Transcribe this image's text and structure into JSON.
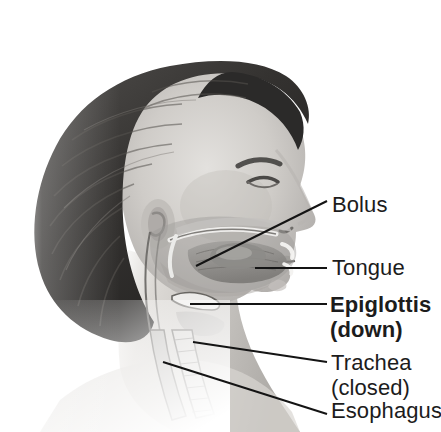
{
  "figure": {
    "width": 441,
    "height": 432,
    "background_color": "#ffffff"
  },
  "marker": {
    "name": "down-triangle-marker",
    "shape": "triangle-down",
    "color": "#2e2e2e"
  },
  "photo": {
    "description": "Grayscale profile photograph of a young person's head and neck with a sagittal anatomical cross-section overlay of the mouth, pharynx, larynx and esophagus.",
    "hair_color": "#3a3a3a",
    "skin_color": "#c9c6c2",
    "overlay_color": "#8e8d8b"
  },
  "labels": [
    {
      "id": "bolus",
      "text": "Bolus",
      "bold": false,
      "lines": [
        "Bolus"
      ]
    },
    {
      "id": "tongue",
      "text": "Tongue",
      "bold": false,
      "lines": [
        "Tongue"
      ]
    },
    {
      "id": "epiglottis",
      "text": "Epiglottis (down)",
      "bold": true,
      "lines": [
        "Epiglottis",
        "(down)"
      ]
    },
    {
      "id": "trachea",
      "text": "Trachea (closed)",
      "bold": false,
      "lines": [
        "Trachea",
        "(closed)"
      ]
    },
    {
      "id": "esophagus",
      "text": "Esophagus",
      "bold": false,
      "lines": [
        "Esophagus"
      ]
    }
  ],
  "label_text": {
    "bolus": "Bolus",
    "tongue": "Tongue",
    "epiglottis_line1": "Epiglottis",
    "epiglottis_line2": "(down)",
    "trachea_line1": "Trachea",
    "trachea_line2": "(closed)",
    "esophagus": "Esophagus"
  },
  "leader_lines": {
    "color": "#141414",
    "width": 2,
    "items": [
      {
        "id": "bolus-leader",
        "from": [
          196,
          266
        ],
        "to": [
          327,
          201
        ]
      },
      {
        "id": "tongue-leader",
        "from": [
          255,
          268
        ],
        "to": [
          327,
          268
        ]
      },
      {
        "id": "epiglottis-leader",
        "from": [
          190,
          304
        ],
        "to": [
          327,
          304
        ]
      },
      {
        "id": "trachea-leader",
        "from": [
          193,
          342
        ],
        "to": [
          327,
          362
        ]
      },
      {
        "id": "esophagus-leader",
        "from": [
          163,
          362
        ],
        "to": [
          327,
          414
        ]
      }
    ]
  }
}
